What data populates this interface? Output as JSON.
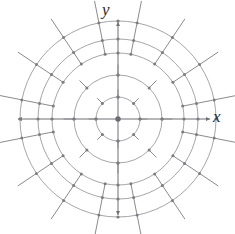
{
  "figure": {
    "title": "",
    "kind": "polar-direction-field",
    "axes": {
      "x_label": "x",
      "y_label": "y",
      "origin": [
        118,
        119
      ],
      "x_axis_from": [
        18,
        119
      ],
      "x_axis_to": [
        210,
        119
      ],
      "y_axis_from": [
        118,
        215
      ],
      "y_axis_to": [
        118,
        22
      ]
    },
    "colors": {
      "ring_stroke": "#8e8e94",
      "axis_stroke": "#6f6f76",
      "tick_stroke": "#8a8a90",
      "dot_fill": "#7b7b82",
      "origin_fill": "#6a6a71",
      "label_color": "#2b2b2b",
      "background": "#ffffff"
    },
    "rings": [
      {
        "index": 1,
        "radius": 22,
        "tick_count": 8,
        "tick_length": 7,
        "angle_step_deg": 45,
        "angle_offset_deg": 45
      },
      {
        "index": 2,
        "radius": 44,
        "tick_count": 8,
        "tick_length": 10,
        "angle_step_deg": 45,
        "angle_offset_deg": 45
      },
      {
        "index": 3,
        "radius": 66,
        "tick_count": 16,
        "tick_length": 13,
        "angle_step_deg": 22.5,
        "angle_offset_deg": 11.25
      },
      {
        "index": 4,
        "radius": 80,
        "tick_count": 16,
        "tick_length": 16,
        "angle_step_deg": 22.5,
        "angle_offset_deg": 11.25
      },
      {
        "index": 5,
        "radius": 98,
        "tick_count": 16,
        "tick_length": 22,
        "angle_step_deg": 22.5,
        "angle_offset_deg": 11.25
      }
    ],
    "axis_dots": {
      "radii": [
        22,
        44,
        66,
        80,
        98
      ],
      "directions_deg": [
        0,
        90,
        180,
        270
      ],
      "dot_radius": 1.6,
      "origin_dot_radius": 2.7
    },
    "arrowheads": {
      "x_positive": true,
      "y_positive": true,
      "x_negative": true,
      "y_negative": true,
      "size": 4
    }
  }
}
